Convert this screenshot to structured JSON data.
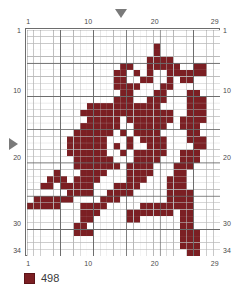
{
  "pattern": {
    "title": "cross-stitch-pattern",
    "columns": 29,
    "rows": 34,
    "cell_px": 6.655,
    "grid_left": 25,
    "grid_top": 28,
    "grid_color": "#b8b8b8",
    "grid_bold_color": "#6d6d6d",
    "bold_every": 5,
    "background": "#ffffff",
    "stitch_color": "#7b1f23",
    "stitch_border": "#5d1418"
  },
  "axes": {
    "top_ticks": [
      {
        "label": "1",
        "col": 1
      },
      {
        "label": "10",
        "col": 10
      },
      {
        "label": "20",
        "col": 20
      },
      {
        "label": "29",
        "col": 29
      }
    ],
    "bottom_ticks": [
      {
        "label": "1",
        "col": 1
      },
      {
        "label": "10",
        "col": 10
      },
      {
        "label": "20",
        "col": 20
      },
      {
        "label": "29",
        "col": 29
      }
    ],
    "left_ticks": [
      {
        "label": "1",
        "row": 1
      },
      {
        "label": "10",
        "row": 10
      },
      {
        "label": "20",
        "row": 20
      },
      {
        "label": "30",
        "row": 30
      },
      {
        "label": "34",
        "row": 34
      }
    ],
    "right_ticks": [
      {
        "label": "1",
        "row": 1
      },
      {
        "label": "10",
        "row": 10
      },
      {
        "label": "20",
        "row": 20
      },
      {
        "label": "30",
        "row": 30
      },
      {
        "label": "34",
        "row": 34
      }
    ]
  },
  "markers": {
    "center_column": {
      "name": "center-column-marker",
      "col": 15,
      "direction": "down"
    },
    "center_row": {
      "name": "center-row-marker",
      "row": 18,
      "direction": "right"
    }
  },
  "legend": {
    "entries": [
      {
        "code": "498",
        "color": "#7b1f23",
        "border": "#5d1418"
      }
    ]
  },
  "chart_data": {
    "type": "heatmap",
    "title": "",
    "xlabel": "",
    "ylabel": "",
    "columns": 29,
    "rows": 34,
    "palette": {
      "0": "#ffffff",
      "1": "#7b1f23"
    },
    "legend_codes": {
      "1": "498"
    },
    "grid": [
      "00000000000000000000000000000",
      "00000000000000000000000000000",
      "00000000000000000001000000000",
      "00000000000000000001000000000",
      "00000000000000000011110000000",
      "00000000000000110011111001100",
      "00000000000001101010011111100",
      "00000000000001100110010110000",
      "00000000000001111000110000000",
      "00000000000000110001100011000",
      "00000000000001110011100011100",
      "00000000011111111111000011100",
      "00000000111111111111110011100",
      "00000000011111011111110111100",
      "00000000111111001111100111000",
      "00000001111110101111000011000",
      "00000011111100010111100011100",
      "00000011111101010011100001100",
      "00000011111100101111100111000",
      "00000001111110001111000111000",
      "00000001111111011110001110000",
      "00001000111100011110001100000",
      "00011101111000011100011100000",
      "00110111110001111000011100000",
      "00000011110011110000011110000",
      "01111110000111000000011110000",
      "11111000111100000111111110000",
      "00000000111000011111110110000",
      "00000000110000011000000110000",
      "00000001100000000000000110000",
      "00000001110000000000000111000",
      "00000000000000000000000111000",
      "00000000000000000000000111000",
      "00000000000000000000000011000"
    ]
  }
}
